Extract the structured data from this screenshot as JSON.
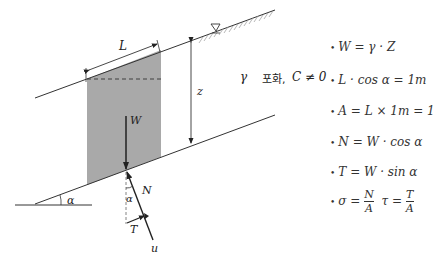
{
  "diagram": {
    "labels": {
      "L": "L",
      "z": "z",
      "gamma_saturated": "γ",
      "saturated": "포화,",
      "cohesion": "C ≠ 0",
      "W": "W",
      "N": "N",
      "T": "T",
      "u": "u",
      "alpha_base": "α",
      "alpha_force": "α"
    },
    "colors": {
      "block_fill": "#a9a9a9",
      "line": "#333333"
    }
  },
  "formulas": [
    {
      "bullet": "•",
      "text": "W = γ · Z"
    },
    {
      "bullet": "•",
      "text": "L · cos α = 1m"
    },
    {
      "bullet": "•",
      "text": "A = L × 1m = 1"
    },
    {
      "bullet": "•",
      "text": "N = W · cos α"
    },
    {
      "bullet": "•",
      "text": "T = W · sin α"
    },
    {
      "bullet": "•",
      "sigma_lhs": "σ =",
      "sigma_num": "N",
      "sigma_den": "A",
      "tau_lhs": "τ =",
      "tau_num": "T",
      "tau_den": "A"
    }
  ]
}
